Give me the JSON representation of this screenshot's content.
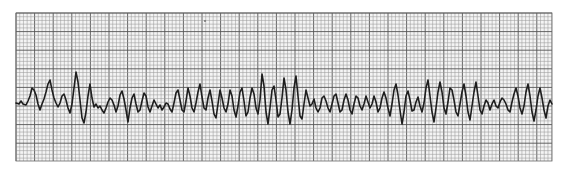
{
  "strip": {
    "kind": "ecg-rhythm-strip",
    "paper_color": "#f4f4f4",
    "grid_minor_color": "#9a9a9a",
    "grid_major_color": "#555555",
    "trace_color": "#1e1e1e",
    "grid": {
      "x0": 16,
      "y0": 13,
      "x1": 552,
      "y1": 161,
      "minor_px": 3.72,
      "major_every": 5
    },
    "baseline_y": 105,
    "waveform_points": [
      [
        16,
        103
      ],
      [
        19,
        104
      ],
      [
        21,
        101
      ],
      [
        23,
        104
      ],
      [
        26,
        105
      ],
      [
        28,
        101
      ],
      [
        30,
        96
      ],
      [
        32,
        88
      ],
      [
        34,
        90
      ],
      [
        36,
        95
      ],
      [
        38,
        104
      ],
      [
        40,
        110
      ],
      [
        42,
        104
      ],
      [
        44,
        99
      ],
      [
        46,
        92
      ],
      [
        48,
        84
      ],
      [
        50,
        80
      ],
      [
        52,
        90
      ],
      [
        54,
        98
      ],
      [
        56,
        103
      ],
      [
        58,
        107
      ],
      [
        60,
        103
      ],
      [
        62,
        96
      ],
      [
        64,
        94
      ],
      [
        66,
        100
      ],
      [
        68,
        108
      ],
      [
        70,
        113
      ],
      [
        72,
        104
      ],
      [
        74,
        88
      ],
      [
        76,
        72
      ],
      [
        78,
        82
      ],
      [
        80,
        100
      ],
      [
        82,
        118
      ],
      [
        84,
        123
      ],
      [
        86,
        112
      ],
      [
        88,
        96
      ],
      [
        90,
        84
      ],
      [
        92,
        98
      ],
      [
        94,
        107
      ],
      [
        96,
        104
      ],
      [
        98,
        108
      ],
      [
        100,
        106
      ],
      [
        102,
        110
      ],
      [
        104,
        113
      ],
      [
        106,
        108
      ],
      [
        108,
        102
      ],
      [
        110,
        98
      ],
      [
        112,
        100
      ],
      [
        114,
        105
      ],
      [
        116,
        112
      ],
      [
        118,
        106
      ],
      [
        120,
        95
      ],
      [
        122,
        91
      ],
      [
        124,
        99
      ],
      [
        126,
        110
      ],
      [
        128,
        122
      ],
      [
        130,
        108
      ],
      [
        132,
        98
      ],
      [
        134,
        94
      ],
      [
        136,
        104
      ],
      [
        138,
        112
      ],
      [
        140,
        110
      ],
      [
        142,
        101
      ],
      [
        144,
        93
      ],
      [
        146,
        96
      ],
      [
        148,
        107
      ],
      [
        150,
        112
      ],
      [
        152,
        106
      ],
      [
        154,
        100
      ],
      [
        156,
        104
      ],
      [
        158,
        108
      ],
      [
        160,
        105
      ],
      [
        162,
        110
      ],
      [
        164,
        107
      ],
      [
        166,
        103
      ],
      [
        168,
        104
      ],
      [
        170,
        109
      ],
      [
        172,
        112
      ],
      [
        174,
        103
      ],
      [
        176,
        93
      ],
      [
        178,
        90
      ],
      [
        180,
        100
      ],
      [
        182,
        110
      ],
      [
        184,
        112
      ],
      [
        186,
        101
      ],
      [
        188,
        88
      ],
      [
        190,
        96
      ],
      [
        192,
        108
      ],
      [
        194,
        112
      ],
      [
        196,
        103
      ],
      [
        198,
        92
      ],
      [
        200,
        84
      ],
      [
        202,
        97
      ],
      [
        204,
        108
      ],
      [
        206,
        110
      ],
      [
        208,
        98
      ],
      [
        210,
        90
      ],
      [
        212,
        101
      ],
      [
        214,
        114
      ],
      [
        216,
        118
      ],
      [
        218,
        104
      ],
      [
        220,
        90
      ],
      [
        222,
        98
      ],
      [
        224,
        108
      ],
      [
        226,
        112
      ],
      [
        228,
        104
      ],
      [
        230,
        90
      ],
      [
        232,
        96
      ],
      [
        234,
        110
      ],
      [
        236,
        117
      ],
      [
        238,
        106
      ],
      [
        240,
        92
      ],
      [
        242,
        88
      ],
      [
        244,
        101
      ],
      [
        246,
        116
      ],
      [
        248,
        112
      ],
      [
        250,
        98
      ],
      [
        252,
        88
      ],
      [
        254,
        94
      ],
      [
        256,
        108
      ],
      [
        258,
        114
      ],
      [
        260,
        100
      ],
      [
        262,
        74
      ],
      [
        264,
        86
      ],
      [
        266,
        112
      ],
      [
        268,
        124
      ],
      [
        270,
        108
      ],
      [
        272,
        90
      ],
      [
        274,
        86
      ],
      [
        276,
        100
      ],
      [
        278,
        117
      ],
      [
        280,
        114
      ],
      [
        282,
        98
      ],
      [
        284,
        78
      ],
      [
        286,
        90
      ],
      [
        288,
        112
      ],
      [
        290,
        124
      ],
      [
        292,
        110
      ],
      [
        294,
        88
      ],
      [
        296,
        76
      ],
      [
        298,
        96
      ],
      [
        300,
        116
      ],
      [
        302,
        119
      ],
      [
        304,
        104
      ],
      [
        306,
        90
      ],
      [
        308,
        98
      ],
      [
        310,
        106
      ],
      [
        312,
        104
      ],
      [
        314,
        99
      ],
      [
        316,
        108
      ],
      [
        318,
        112
      ],
      [
        320,
        108
      ],
      [
        322,
        98
      ],
      [
        324,
        96
      ],
      [
        326,
        101
      ],
      [
        328,
        108
      ],
      [
        330,
        112
      ],
      [
        332,
        104
      ],
      [
        334,
        96
      ],
      [
        336,
        94
      ],
      [
        338,
        103
      ],
      [
        340,
        112
      ],
      [
        342,
        110
      ],
      [
        344,
        100
      ],
      [
        346,
        94
      ],
      [
        348,
        100
      ],
      [
        350,
        110
      ],
      [
        352,
        114
      ],
      [
        354,
        104
      ],
      [
        356,
        96
      ],
      [
        358,
        98
      ],
      [
        360,
        106
      ],
      [
        362,
        110
      ],
      [
        364,
        104
      ],
      [
        366,
        96
      ],
      [
        368,
        102
      ],
      [
        370,
        108
      ],
      [
        372,
        104
      ],
      [
        374,
        96
      ],
      [
        376,
        102
      ],
      [
        378,
        112
      ],
      [
        380,
        108
      ],
      [
        382,
        98
      ],
      [
        384,
        92
      ],
      [
        386,
        98
      ],
      [
        388,
        108
      ],
      [
        390,
        116
      ],
      [
        392,
        104
      ],
      [
        394,
        90
      ],
      [
        396,
        84
      ],
      [
        398,
        95
      ],
      [
        400,
        110
      ],
      [
        402,
        124
      ],
      [
        404,
        112
      ],
      [
        406,
        96
      ],
      [
        408,
        91
      ],
      [
        410,
        100
      ],
      [
        412,
        111
      ],
      [
        414,
        110
      ],
      [
        416,
        102
      ],
      [
        418,
        97
      ],
      [
        420,
        106
      ],
      [
        422,
        112
      ],
      [
        424,
        103
      ],
      [
        426,
        88
      ],
      [
        428,
        80
      ],
      [
        430,
        96
      ],
      [
        432,
        112
      ],
      [
        434,
        122
      ],
      [
        436,
        108
      ],
      [
        438,
        92
      ],
      [
        440,
        82
      ],
      [
        442,
        92
      ],
      [
        444,
        108
      ],
      [
        446,
        114
      ],
      [
        448,
        102
      ],
      [
        450,
        88
      ],
      [
        452,
        90
      ],
      [
        454,
        100
      ],
      [
        456,
        112
      ],
      [
        458,
        116
      ],
      [
        460,
        104
      ],
      [
        462,
        92
      ],
      [
        464,
        84
      ],
      [
        466,
        96
      ],
      [
        468,
        112
      ],
      [
        470,
        120
      ],
      [
        472,
        106
      ],
      [
        474,
        92
      ],
      [
        476,
        82
      ],
      [
        478,
        96
      ],
      [
        480,
        110
      ],
      [
        482,
        114
      ],
      [
        484,
        106
      ],
      [
        486,
        100
      ],
      [
        488,
        103
      ],
      [
        490,
        110
      ],
      [
        492,
        104
      ],
      [
        494,
        100
      ],
      [
        496,
        106
      ],
      [
        498,
        108
      ],
      [
        500,
        102
      ],
      [
        502,
        98
      ],
      [
        504,
        100
      ],
      [
        506,
        104
      ],
      [
        508,
        110
      ],
      [
        510,
        112
      ],
      [
        512,
        102
      ],
      [
        514,
        94
      ],
      [
        516,
        88
      ],
      [
        518,
        96
      ],
      [
        520,
        108
      ],
      [
        522,
        114
      ],
      [
        524,
        106
      ],
      [
        526,
        92
      ],
      [
        528,
        84
      ],
      [
        530,
        96
      ],
      [
        532,
        112
      ],
      [
        534,
        121
      ],
      [
        536,
        110
      ],
      [
        538,
        96
      ],
      [
        540,
        88
      ],
      [
        542,
        98
      ],
      [
        544,
        110
      ],
      [
        546,
        118
      ],
      [
        548,
        106
      ],
      [
        550,
        100
      ],
      [
        552,
        104
      ]
    ]
  }
}
